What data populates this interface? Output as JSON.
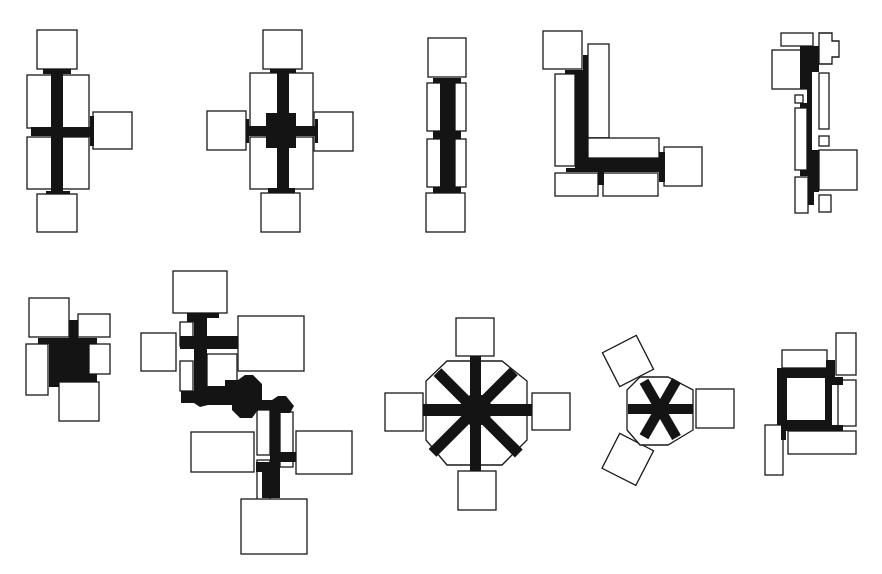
{
  "diagram": {
    "colors": {
      "background": "#ffffff",
      "room_fill": "#ffffff",
      "room_stroke": "#1a1a1a",
      "corridor": "#141414"
    },
    "plans": [
      {
        "id": "cross-asymmetric",
        "label": "Cross plan with three end wings"
      },
      {
        "id": "cross-symmetric",
        "label": "Cross plan with four end wings"
      },
      {
        "id": "linear-double-loaded",
        "label": "Linear double-loaded corridor"
      },
      {
        "id": "l-shaped",
        "label": "L-shaped corridor"
      },
      {
        "id": "linear-staggered",
        "label": "Linear staggered corridor"
      },
      {
        "id": "compact-hall",
        "label": "Compact central hall"
      },
      {
        "id": "branching-chain",
        "label": "Branching chain of cross nodes"
      },
      {
        "id": "radial-octagon",
        "label": "Radial octagonal hub"
      },
      {
        "id": "radial-triangle",
        "label": "Radial three-wing hub"
      },
      {
        "id": "courtyard-ring",
        "label": "Square ring corridor"
      }
    ]
  }
}
